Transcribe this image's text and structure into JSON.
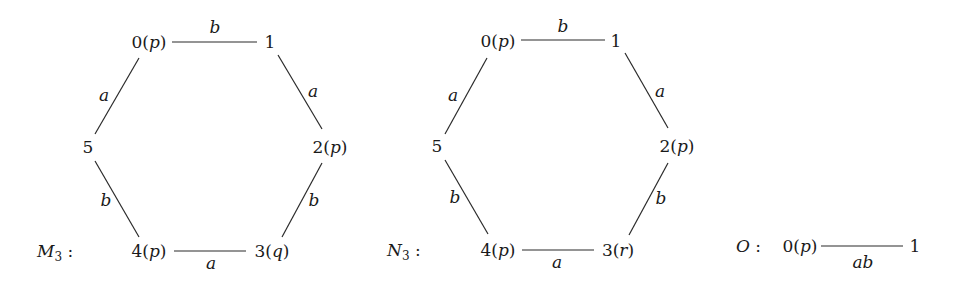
{
  "diagrams": [
    {
      "name": "M",
      "subscript": "3",
      "label_suffix": " :",
      "nodes": {
        "n0": {
          "num": "0",
          "prop": "p"
        },
        "n1": {
          "num": "1",
          "prop": ""
        },
        "n2": {
          "num": "2",
          "prop": "p"
        },
        "n3": {
          "num": "3",
          "prop": "q"
        },
        "n4": {
          "num": "4",
          "prop": "p"
        },
        "n5": {
          "num": "5",
          "prop": ""
        }
      },
      "edges": {
        "e01": {
          "from": "0",
          "to": "1",
          "label": "b"
        },
        "e12": {
          "from": "1",
          "to": "2",
          "label": "a"
        },
        "e23": {
          "from": "2",
          "to": "3",
          "label": "b"
        },
        "e34": {
          "from": "3",
          "to": "4",
          "label": "a"
        },
        "e45": {
          "from": "4",
          "to": "5",
          "label": "b"
        },
        "e50": {
          "from": "5",
          "to": "0",
          "label": "a"
        }
      }
    },
    {
      "name": "N",
      "subscript": "3",
      "label_suffix": " :",
      "nodes": {
        "n0": {
          "num": "0",
          "prop": "p"
        },
        "n1": {
          "num": "1",
          "prop": ""
        },
        "n2": {
          "num": "2",
          "prop": "p"
        },
        "n3": {
          "num": "3",
          "prop": "r"
        },
        "n4": {
          "num": "4",
          "prop": "p"
        },
        "n5": {
          "num": "5",
          "prop": ""
        }
      },
      "edges": {
        "e01": {
          "from": "0",
          "to": "1",
          "label": "b"
        },
        "e12": {
          "from": "1",
          "to": "2",
          "label": "a"
        },
        "e23": {
          "from": "2",
          "to": "3",
          "label": "b"
        },
        "e34": {
          "from": "3",
          "to": "4",
          "label": "a"
        },
        "e45": {
          "from": "4",
          "to": "5",
          "label": "b"
        },
        "e50": {
          "from": "5",
          "to": "0",
          "label": "a"
        }
      }
    },
    {
      "name": "O",
      "subscript": "",
      "label_suffix": " :",
      "nodes": {
        "n0": {
          "num": "0",
          "prop": "p"
        },
        "n1": {
          "num": "1",
          "prop": ""
        }
      },
      "edges": {
        "e01": {
          "from": "0",
          "to": "1",
          "label": "ab"
        }
      }
    }
  ]
}
